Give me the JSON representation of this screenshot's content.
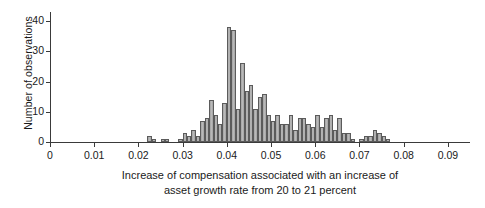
{
  "chart_data": {
    "type": "bar",
    "title": "",
    "subtitle": "",
    "xlabel_line1": "Increase of compensation associated with an increase of",
    "xlabel_line2": "asset growth rate from 20 to 21 percent",
    "ylabel": "Number of observations",
    "xlim": [
      0,
      0.095
    ],
    "ylim": [
      0,
      43
    ],
    "grid": false,
    "legend": null,
    "bin_width": 0.001,
    "xticks": [
      0,
      0.01,
      0.02,
      0.03,
      0.04,
      0.05,
      0.06,
      0.07,
      0.08,
      0.09
    ],
    "xtick_labels": [
      "0",
      "0.01",
      "0.02",
      "0.03",
      "0.04",
      "0.05",
      "0.06",
      "0.07",
      "0.08",
      "0.09"
    ],
    "yticks": [
      0,
      10,
      20,
      30,
      40
    ],
    "ytick_labels": [
      "0",
      "10",
      "20",
      "30",
      "40"
    ],
    "bar_fill": "#b0b0b0",
    "bar_edge": "#5b5b5b",
    "axis_color": "#3a3a3a",
    "x": [
      0.0225,
      0.0235,
      0.0245,
      0.0255,
      0.0265,
      0.0275,
      0.0285,
      0.0295,
      0.0305,
      0.0315,
      0.0325,
      0.0335,
      0.0345,
      0.0355,
      0.0365,
      0.0375,
      0.0385,
      0.0395,
      0.0405,
      0.0415,
      0.0425,
      0.0435,
      0.0445,
      0.0455,
      0.0465,
      0.0475,
      0.0485,
      0.0495,
      0.0505,
      0.0515,
      0.0525,
      0.0535,
      0.0545,
      0.0555,
      0.0565,
      0.0575,
      0.0585,
      0.0595,
      0.0605,
      0.0615,
      0.0625,
      0.0635,
      0.0645,
      0.0655,
      0.0665,
      0.0675,
      0.0685,
      0.0695,
      0.0705,
      0.0715,
      0.0725,
      0.0735,
      0.0745,
      0.0755,
      0.0765,
      0.0775
    ],
    "values": [
      2,
      1,
      0,
      1,
      1,
      0,
      0,
      1,
      3,
      2,
      4,
      2,
      7,
      8,
      14,
      9,
      6,
      13,
      38,
      37,
      11,
      26,
      17,
      19,
      11,
      15,
      16,
      9,
      7,
      9,
      6,
      6,
      9,
      4,
      8,
      8,
      6,
      5,
      9,
      5,
      8,
      9,
      4,
      8,
      3,
      3,
      1,
      0,
      1,
      2,
      2,
      4,
      3,
      2,
      1,
      0
    ]
  }
}
